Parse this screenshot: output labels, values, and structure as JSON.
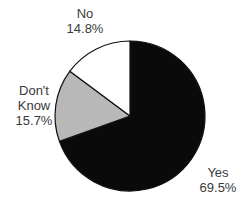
{
  "chart_data": {
    "type": "pie",
    "title": "",
    "start_angle_deg": 0,
    "direction": "clockwise",
    "slices": [
      {
        "label": "Yes",
        "value": 69.5,
        "display": "69.5%",
        "color": "#0a0a0a"
      },
      {
        "label": "Don't Know",
        "value": 15.7,
        "display": "15.7%",
        "color": "#b8b8b8"
      },
      {
        "label": "No",
        "value": 14.8,
        "display": "14.8%",
        "color": "#ffffff"
      }
    ],
    "categories": [
      "Yes",
      "Don't Know",
      "No"
    ],
    "values": [
      69.5,
      15.7,
      14.8
    ],
    "legend": "none (direct labels)"
  },
  "labels": {
    "no": {
      "line1": "No",
      "line2": "14.8%"
    },
    "dont_know": {
      "line1": "Don't",
      "line2": "Know",
      "line3": "15.7%"
    },
    "yes": {
      "line1": "Yes",
      "line2": "69.5%"
    }
  }
}
